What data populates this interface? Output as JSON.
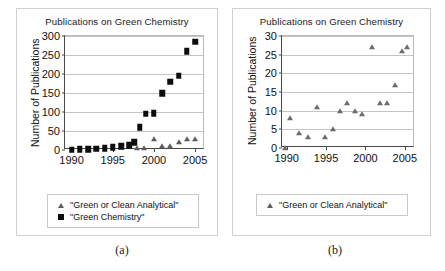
{
  "figure": {
    "background": "#ffffff",
    "frame_color": "#cfcfcf"
  },
  "panels": [
    {
      "id": "a",
      "caption": "(a)",
      "title": "Publications on Green Chemistry",
      "ylabel": "Number of Publications",
      "yticks": [
        "300",
        "250",
        "200",
        "150",
        "100",
        "50",
        "0"
      ],
      "xticks": [
        "1990",
        "1995",
        "2000",
        "2005"
      ],
      "legend": [
        {
          "marker": "triangle",
          "label": "\"Green or Clean Analytical\""
        },
        {
          "marker": "square",
          "label": "\"Green Chemistry\""
        }
      ]
    },
    {
      "id": "b",
      "caption": "(b)",
      "title": "Publications on Green Chemistry",
      "ylabel": "Number of Publications",
      "yticks": [
        "30",
        "25",
        "20",
        "15",
        "10",
        "5",
        "0"
      ],
      "xticks": [
        "1990",
        "1995",
        "2000",
        "2005"
      ],
      "legend": [
        {
          "marker": "triangle",
          "label": "\"Green or Clean Analytical\""
        }
      ]
    }
  ],
  "chart_data": [
    {
      "type": "scatter",
      "panel": "a",
      "title": "Publications on Green Chemistry",
      "xlabel": "",
      "ylabel": "Number of Publications",
      "xlim": [
        1989.2,
        2006.2
      ],
      "ylim": [
        0,
        300
      ],
      "ytick_values": [
        0,
        50,
        100,
        150,
        200,
        250,
        300
      ],
      "xtick_values": [
        1990,
        1995,
        2000,
        2005
      ],
      "grid": "horizontal",
      "legend_position": "below-axes",
      "series": [
        {
          "name": "\"Green Chemistry\"",
          "marker": "square",
          "color": "#0d0d0d",
          "x": [
            1990,
            1991,
            1992,
            1993,
            1994,
            1995,
            1996,
            1997,
            1997.6,
            1998.3,
            1999,
            2000,
            2001,
            2002,
            2003,
            2004,
            2005
          ],
          "values": [
            1,
            2,
            2,
            3,
            5,
            7,
            10,
            13,
            20,
            60,
            95,
            97,
            149,
            180,
            195,
            260,
            285
          ]
        },
        {
          "name": "\"Green or Clean Analytical\"",
          "marker": "triangle",
          "color": "#5d5d5d",
          "x": [
            1998,
            1998.8,
            2000,
            2001,
            2002,
            2003,
            2004,
            2005
          ],
          "values": [
            6,
            6,
            30,
            10,
            11,
            20,
            30,
            30
          ]
        }
      ]
    },
    {
      "type": "scatter",
      "panel": "b",
      "title": "Publications on Green Chemistry",
      "xlabel": "",
      "ylabel": "Number of Publications",
      "xlim": [
        1989.4,
        2006.3
      ],
      "ylim": [
        0,
        30
      ],
      "ytick_values": [
        0,
        5,
        10,
        15,
        20,
        25,
        30
      ],
      "xtick_values": [
        1990,
        1995,
        2000,
        2005
      ],
      "grid": "horizontal",
      "legend_position": "below-axes",
      "series": [
        {
          "name": "\"Green or Clean Analytical\"",
          "marker": "triangle",
          "color": "#6b6b6b",
          "x": [
            1989.8,
            1990.4,
            1991.6,
            1992.7,
            1993.9,
            1994.9,
            1995.9,
            1996.8,
            1997.6,
            1998.7,
            1999.6,
            2000.8,
            2001.8,
            2002.7,
            2003.8,
            2004.6,
            2005.3
          ],
          "values": [
            0,
            8,
            4,
            3,
            11,
            3,
            5,
            10,
            12,
            10,
            9,
            27,
            12,
            12,
            17,
            26,
            27
          ]
        }
      ]
    }
  ]
}
